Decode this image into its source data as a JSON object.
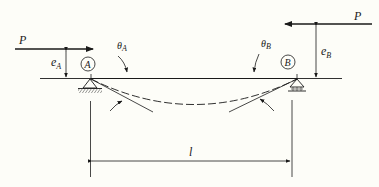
{
  "figure": {
    "background": "#fdfdf8",
    "ink": "#1a1a1a",
    "beam_gradient": [
      "#c070c0",
      "#80e080",
      "#c070c0"
    ]
  },
  "labels": {
    "load_left": "P",
    "load_right": "P",
    "ecc_left_main": "e",
    "ecc_left_sub": "A",
    "ecc_right_main": "e",
    "ecc_right_sub": "B",
    "node_a": "A",
    "node_b": "B",
    "theta_a_main": "θ",
    "theta_a_sub": "A",
    "theta_b_main": "θ",
    "theta_b_sub": "B",
    "span": "l"
  },
  "elements": {
    "left_support": "pin-support",
    "right_support": "roller-support",
    "deflected_shape": "dashed-curve",
    "tangent_lines": [
      "tangent-at-A",
      "tangent-at-B"
    ]
  }
}
